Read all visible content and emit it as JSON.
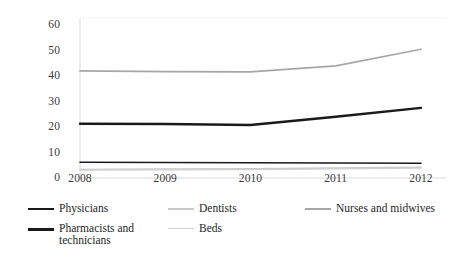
{
  "chart_data": {
    "type": "line",
    "title": "",
    "xlabel": "",
    "ylabel": "",
    "x": [
      2008,
      2009,
      2010,
      2011,
      2012
    ],
    "categories": [
      "2008",
      "2009",
      "2010",
      "2011",
      "2012"
    ],
    "xlim": [
      2008,
      2012
    ],
    "ylim": [
      0,
      60
    ],
    "yticks": [
      0,
      10,
      20,
      30,
      40,
      50,
      60
    ],
    "ytick_labels": [
      "0",
      "10",
      "20",
      "30",
      "40",
      "50",
      "60"
    ],
    "grid": false,
    "legend_position": "bottom",
    "series": [
      {
        "name": "Physicians",
        "color": "#1a1a1a",
        "width": 1.6,
        "values": [
          6.2,
          6.1,
          6.0,
          5.9,
          5.8
        ]
      },
      {
        "name": "Dentists",
        "color": "#c9c9c9",
        "width": 1.4,
        "values": [
          3.4,
          3.5,
          3.6,
          3.9,
          4.2
        ]
      },
      {
        "name": "Nurses and midwives",
        "color": "#a6a6a6",
        "width": 1.7,
        "values": [
          42.0,
          41.7,
          41.6,
          44.0,
          50.5
        ]
      },
      {
        "name": "Pharmacists and\ntechnicians",
        "color": "#1a1a1a",
        "width": 2.4,
        "values": [
          21.3,
          21.2,
          20.8,
          24.0,
          27.5
        ]
      },
      {
        "name": "Beds",
        "color": "#d0d0d0",
        "width": 1.3,
        "values": [
          3.1,
          3.2,
          3.3,
          3.6,
          3.9
        ]
      }
    ]
  },
  "axis": {
    "y_labels": [
      "60",
      "50",
      "40",
      "30",
      "20",
      "10",
      "0"
    ],
    "x_labels": [
      "2008",
      "2009",
      "2010",
      "2011",
      "2012"
    ]
  },
  "legend": {
    "items": [
      {
        "label": "Physicians",
        "color": "#1a1a1a",
        "thickness": "1.8px"
      },
      {
        "label": "Dentists",
        "color": "#c9c9c9",
        "thickness": "1.5px"
      },
      {
        "label": "Nurses and midwives",
        "color": "#a6a6a6",
        "thickness": "1.6px"
      },
      {
        "label": "Pharmacists and\ntechnicians",
        "color": "#1a1a1a",
        "thickness": "2.6px"
      },
      {
        "label": "Beds",
        "color": "#d0d0d0",
        "thickness": "1.4px"
      }
    ]
  },
  "colors": {
    "axis_line": "#d9d9d9",
    "text": "#2b2b2b",
    "background": "#ffffff"
  }
}
